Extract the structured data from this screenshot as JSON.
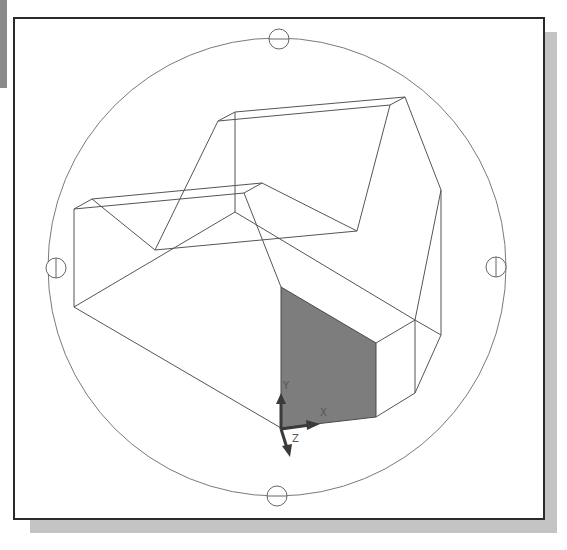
{
  "viewport": {
    "name": "3D wireframe model viewport (3D orbit view)",
    "background": "#ffffff",
    "frame_color": "#2a2a2a",
    "shadow_color": "#c4c4c4"
  },
  "orbit": {
    "arcball_circle": {
      "cx": 277,
      "cy": 267,
      "r": 229
    },
    "grips": [
      {
        "id": "top",
        "cx": 279,
        "cy": 39,
        "r": 10
      },
      {
        "id": "left",
        "cx": 56,
        "cy": 268,
        "r": 10
      },
      {
        "id": "right",
        "cx": 496,
        "cy": 267,
        "r": 10
      },
      {
        "id": "bottom",
        "cx": 277,
        "cy": 496,
        "r": 10
      }
    ]
  },
  "model": {
    "line_color": "#555555",
    "highlighted_face_color": "#7d7d7d"
  },
  "ucs_icon": {
    "x_label": "X",
    "y_label": "Y",
    "z_label": "Z",
    "color": "#3a3a3a"
  }
}
